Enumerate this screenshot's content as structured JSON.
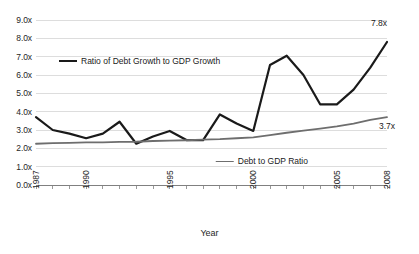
{
  "chart_data": {
    "type": "line",
    "title": "",
    "xlabel": "Year",
    "ylabel": "",
    "grid": "horizontal",
    "legend_position": "inside-plot",
    "x": [
      1987,
      1988,
      1989,
      1990,
      1991,
      1992,
      1993,
      1994,
      1995,
      1996,
      1997,
      1998,
      1999,
      2000,
      2001,
      2002,
      2003,
      2004,
      2005,
      2006,
      2007,
      2008
    ],
    "xlim": [
      1987,
      2008
    ],
    "ylim": [
      0.0,
      9.0
    ],
    "y_ticks": [
      "0.0x",
      "1.0x",
      "2.0x",
      "3.0x",
      "4.0x",
      "5.0x",
      "6.0x",
      "7.0x",
      "8.0x",
      "9.0x"
    ],
    "y_tick_values": [
      0.0,
      1.0,
      2.0,
      3.0,
      4.0,
      5.0,
      6.0,
      7.0,
      8.0,
      9.0
    ],
    "x_tick_labels": [
      "1987",
      "1990",
      "1995",
      "2000",
      "2005",
      "2008"
    ],
    "x_tick_values": [
      1987,
      1990,
      1995,
      2000,
      2005,
      2008
    ],
    "series": [
      {
        "name": "Ratio of Debt Growth to GDP Growth",
        "color": "#1a1a1a",
        "width": 2.2,
        "values": [
          3.7,
          3.0,
          2.8,
          2.55,
          2.8,
          3.45,
          2.25,
          2.65,
          2.95,
          2.45,
          2.45,
          3.85,
          3.35,
          2.95,
          6.55,
          7.05,
          6.0,
          4.4,
          4.4,
          5.2,
          6.4,
          7.8
        ]
      },
      {
        "name": "Debt to GDP Ratio",
        "color": "#6e6e6e",
        "width": 1.8,
        "values": [
          2.25,
          2.28,
          2.3,
          2.32,
          2.33,
          2.35,
          2.36,
          2.4,
          2.42,
          2.44,
          2.47,
          2.5,
          2.55,
          2.6,
          2.72,
          2.85,
          2.96,
          3.08,
          3.2,
          3.35,
          3.55,
          3.7
        ]
      }
    ],
    "annotations": [
      {
        "text": "7.8x",
        "series": "Ratio of Debt Growth to GDP Growth",
        "x": 2008,
        "y": 7.8
      },
      {
        "text": "3.7x",
        "series": "Debt to GDP Ratio",
        "x": 2008,
        "y": 3.7
      }
    ]
  },
  "legend": {
    "ratio_label": "Ratio of Debt Growth to GDP Growth",
    "debt_label": "Debt to GDP Ratio"
  },
  "axes": {
    "x_title": "Year"
  },
  "labels": {
    "ratio_last": "7.8x",
    "debt_last": "3.7x"
  },
  "colors": {
    "ratio_series": "#1a1a1a",
    "debt_series": "#6e6e6e",
    "grid": "#d4d4d4",
    "axis": "#808080",
    "background": "#ffffff",
    "text": "#262626"
  }
}
